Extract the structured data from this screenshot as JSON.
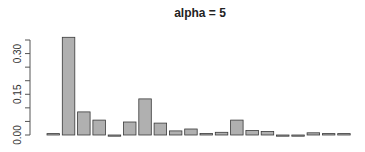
{
  "chart_data": {
    "type": "bar",
    "title": "alpha = 5",
    "xlabel": "",
    "ylabel": "",
    "ylim": [
      0,
      0.35
    ],
    "yticks": [
      0.0,
      0.05,
      0.1,
      0.15,
      0.2,
      0.25,
      0.3,
      0.35
    ],
    "ytick_labels": [
      "0.00",
      "",
      "",
      "0.15",
      "",
      "",
      "0.30",
      ""
    ],
    "grid": false,
    "legend": null,
    "categories": [
      "1",
      "2",
      "3",
      "4",
      "5",
      "6",
      "7",
      "8",
      "9",
      "10",
      "11",
      "12",
      "13",
      "14",
      "15",
      "16",
      "17",
      "18",
      "19",
      "20"
    ],
    "values": [
      0.005,
      0.36,
      0.085,
      0.055,
      -0.002,
      0.048,
      0.133,
      0.044,
      0.015,
      0.022,
      0.006,
      0.01,
      0.055,
      0.017,
      0.013,
      -0.003,
      -0.004,
      0.008,
      0.005,
      0.005
    ],
    "bar_color": "#b0b0b0",
    "bar_border": "#3a3a3a"
  }
}
